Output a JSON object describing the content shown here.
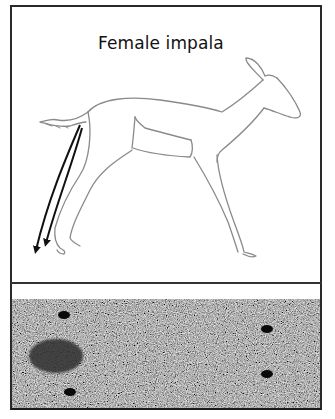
{
  "figure": {
    "title": "Female impala",
    "panels": [
      {
        "name": "impala-drawing",
        "description": "Line drawing of female impala in mid-stride with two black arrows pointing down from the tail toward the ground"
      },
      {
        "name": "ground-substrate",
        "description": "Speckled gray ground texture with small black pellets and a dark blotch"
      }
    ],
    "arrows": [
      {
        "name": "arrow-1",
        "color": "#111111"
      },
      {
        "name": "arrow-2",
        "color": "#111111"
      }
    ],
    "pellets": [
      {
        "name": "pellet-1",
        "cx": 62,
        "cy": 315
      },
      {
        "name": "pellet-2",
        "cx": 68,
        "cy": 392
      },
      {
        "name": "pellet-3",
        "cx": 265,
        "cy": 329
      },
      {
        "name": "pellet-4",
        "cx": 265,
        "cy": 374
      }
    ],
    "blotch": {
      "cx": 54,
      "cy": 356
    },
    "colors": {
      "frame": "#2a2a2a",
      "outline": "#8a8a8a",
      "arrow": "#111111",
      "ground": "#7a7a7a",
      "pellet": "#0a0a0a",
      "blotch": "#2e2e2e"
    }
  }
}
